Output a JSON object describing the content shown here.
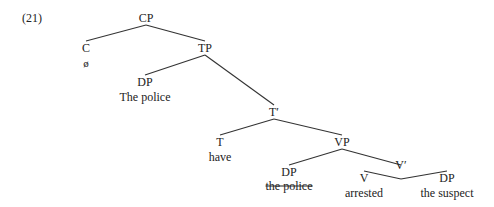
{
  "example_number": "(21)",
  "nodes": {
    "cp": {
      "label": "CP"
    },
    "c": {
      "label": "C",
      "word": "ø"
    },
    "tp": {
      "label": "TP"
    },
    "dp_subj": {
      "label": "DP",
      "word": "The police"
    },
    "tbar": {
      "label": "T′"
    },
    "t": {
      "label": "T",
      "word": "have"
    },
    "vp": {
      "label": "VP"
    },
    "dp_trace": {
      "label": "DP",
      "word": "the police",
      "struck_through": true
    },
    "vbar": {
      "label": "V′"
    },
    "v": {
      "label": "V",
      "word": "arrested"
    },
    "dp_obj": {
      "label": "DP",
      "word": "the suspect"
    }
  },
  "colors": {
    "line": "#333333",
    "text": "#222222"
  }
}
